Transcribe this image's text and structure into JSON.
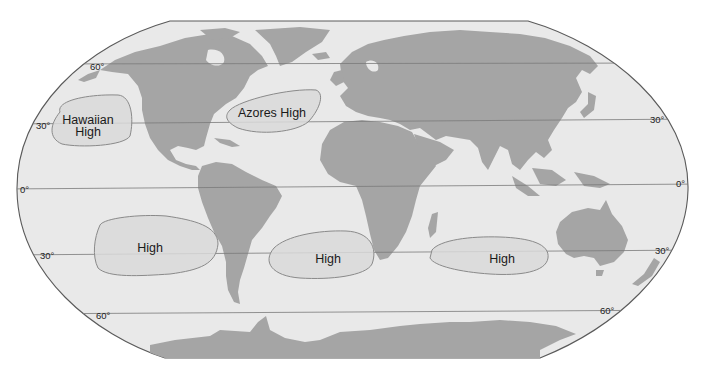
{
  "map": {
    "title": "Subtropical high-pressure cells",
    "colors": {
      "ocean": "#e9e9e9",
      "land": "#a5a5a5",
      "high_zone": "#d9d9d9",
      "outline": "#5a5a5a"
    },
    "latitude_labels": {
      "n60_left": "60°",
      "n30_left": "30°",
      "n30_right": "30°",
      "eq_left": "0°",
      "eq_right": "0°",
      "s30_left": "30°",
      "s30_right": "30°",
      "s60_left": "60°",
      "s60_right": "60°"
    },
    "pressure_cells": [
      {
        "id": "hawaiian",
        "label_line1": "Hawaiian",
        "label_line2": "High"
      },
      {
        "id": "azores",
        "label_line1": "Azores High"
      },
      {
        "id": "south-pacific",
        "label_line1": "High"
      },
      {
        "id": "south-atlantic",
        "label_line1": "High"
      },
      {
        "id": "indian-ocean",
        "label_line1": "High"
      }
    ]
  }
}
